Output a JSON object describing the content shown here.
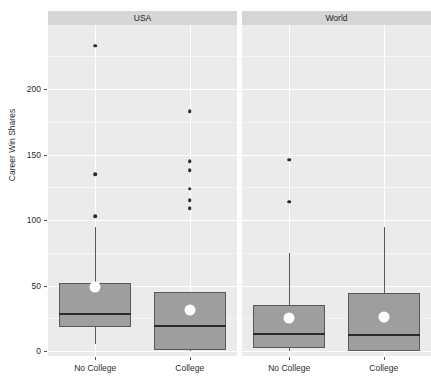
{
  "figure": {
    "clipped_top_text": "",
    "panel_gap_px": 5
  },
  "axes": {
    "y_title": "Career Win Shares",
    "y_ticks": [
      0,
      50,
      100,
      150,
      200
    ],
    "y_tick_labels": [
      "0",
      "50",
      "100",
      "150",
      "200"
    ],
    "y_minor_ticks": [
      25,
      75,
      125,
      175,
      225
    ],
    "x_categories": [
      "No College",
      "College"
    ]
  },
  "panels": [
    {
      "strip_label": "USA"
    },
    {
      "strip_label": "World"
    }
  ],
  "colors": {
    "panel_background": "#ebebeb",
    "strip_background": "#d6d6d6",
    "gridline": "#ffffff",
    "box_fill": "#9e9e9e",
    "box_border": "#595959",
    "median_line": "#2b2b2b",
    "mean_point": "#ffffff",
    "outlier_point": "#2b2b2b",
    "text": "#2b2b2b"
  },
  "chart_data": {
    "type": "boxplot",
    "title": "",
    "xlabel": "",
    "ylabel": "Career Win Shares",
    "ylim": [
      -5,
      243
    ],
    "y_ticks": [
      0,
      50,
      100,
      150,
      200
    ],
    "grid": true,
    "legend": "none",
    "facets": [
      "USA",
      "World"
    ],
    "categories": [
      "No College",
      "College"
    ],
    "groups": [
      {
        "facet": "USA",
        "category": "No College",
        "whisker_low": 5,
        "q1": 18,
        "median": 29,
        "q3": 52,
        "whisker_high": 95,
        "mean": 49,
        "outliers": [
          233,
          135,
          103
        ]
      },
      {
        "facet": "USA",
        "category": "College",
        "whisker_low": 0,
        "q1": 1,
        "median": 20,
        "q3": 45,
        "whisker_high": 45,
        "mean": 31,
        "outliers": [
          183,
          145,
          138,
          124,
          115,
          109
        ]
      },
      {
        "facet": "World",
        "category": "No College",
        "whisker_low": 0,
        "q1": 2,
        "median": 14,
        "q3": 35,
        "whisker_high": 75,
        "mean": 25,
        "outliers": [
          146,
          114
        ]
      },
      {
        "facet": "World",
        "category": "College",
        "whisker_low": 0,
        "q1": 0,
        "median": 13,
        "q3": 44,
        "whisker_high": 95,
        "mean": 26,
        "outliers": []
      }
    ]
  }
}
